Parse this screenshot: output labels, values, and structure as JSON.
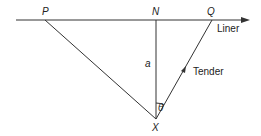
{
  "labels": {
    "P": "P",
    "N": "N",
    "Q": "Q",
    "X": "X",
    "a": "a",
    "theta": "θ",
    "liner": "Liner",
    "tender": "Tender"
  },
  "geometry": {
    "line_y": 20,
    "line_x_start": 16,
    "line_x_end": 250,
    "P": [
      45,
      20
    ],
    "N": [
      156,
      20
    ],
    "Q": [
      212,
      20
    ],
    "X": [
      156,
      119
    ]
  },
  "colors": {
    "stroke": "#333333",
    "background": "#ffffff"
  }
}
